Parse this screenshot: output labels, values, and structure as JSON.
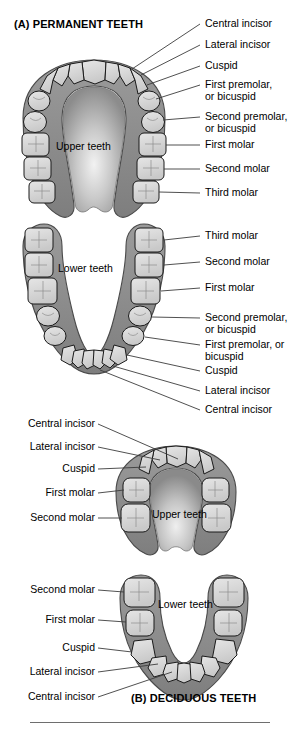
{
  "figure": {
    "background": "#ffffff",
    "tooth_fill": "#d9d9d9",
    "tooth_stroke": "#1a1a1a",
    "gum_fill": "#8f8f8f",
    "gum_stroke": "#4a4a4a",
    "palate_fill": "#a6a6a6",
    "leader_color": "#3c3c3c"
  },
  "panel_a": {
    "title": "(A) PERMANENT TEETH",
    "upper_caption": "Upper teeth",
    "lower_caption": "Lower teeth",
    "upper_labels": [
      {
        "text": "Central incisor"
      },
      {
        "text": "Lateral incisor"
      },
      {
        "text": "Cuspid"
      },
      {
        "text": "First premolar,\nor bicuspid"
      },
      {
        "text": "Second premolar,\nor bicuspid"
      },
      {
        "text": "First molar"
      },
      {
        "text": "Second molar"
      },
      {
        "text": "Third molar"
      }
    ],
    "lower_labels": [
      {
        "text": "Third molar"
      },
      {
        "text": "Second molar"
      },
      {
        "text": "First molar"
      },
      {
        "text": "Second premolar,\nor bicuspid"
      },
      {
        "text": "First premolar, or\nbicuspid"
      },
      {
        "text": "Cuspid"
      },
      {
        "text": "Lateral incisor"
      },
      {
        "text": "Central incisor"
      }
    ]
  },
  "panel_b": {
    "title": "(B) DECIDUOUS TEETH",
    "upper_caption": "Upper teeth",
    "lower_caption": "Lower teeth",
    "upper_labels": [
      {
        "text": "Central incisor"
      },
      {
        "text": "Lateral incisor"
      },
      {
        "text": "Cuspid"
      },
      {
        "text": "First molar"
      },
      {
        "text": "Second molar"
      }
    ],
    "lower_labels": [
      {
        "text": "Second molar"
      },
      {
        "text": "First molar"
      },
      {
        "text": "Cuspid"
      },
      {
        "text": "Lateral incisor"
      },
      {
        "text": "Central incisor"
      }
    ]
  }
}
